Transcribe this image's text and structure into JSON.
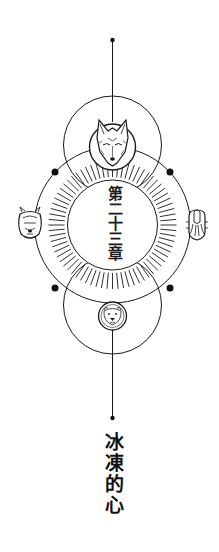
{
  "chapter": {
    "label": "第二十三章"
  },
  "title": {
    "text": "冰凍的心"
  },
  "emblem": {
    "top_medallion": "wolf-head",
    "left_medallion": "lion-head",
    "right_medallion": "kraken-squid",
    "bottom_medallion": "bear-head"
  },
  "colors": {
    "background": "#ffffff",
    "ink": "#1a1a1a"
  }
}
